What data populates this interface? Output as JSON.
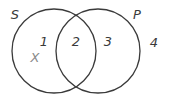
{
  "diagram": {
    "type": "venn",
    "stroke_color": "#3a3a3a",
    "sets": [
      {
        "id": "S",
        "label": "S",
        "cx": 54,
        "cy": 51,
        "r": 42
      },
      {
        "id": "P",
        "label": "P",
        "cx": 98,
        "cy": 51,
        "r": 42
      }
    ],
    "set_labels": [
      {
        "text": "S",
        "x": 15,
        "y": 14
      },
      {
        "text": "P",
        "x": 137,
        "y": 14
      }
    ],
    "regions": [
      {
        "text": "1",
        "x": 44,
        "y": 41
      },
      {
        "text": "2",
        "x": 76,
        "y": 41
      },
      {
        "text": "3",
        "x": 108,
        "y": 41
      },
      {
        "text": "4",
        "x": 154,
        "y": 42
      }
    ],
    "marker": {
      "text": "X",
      "x": 35,
      "y": 57,
      "color": "#8a8a8a"
    }
  }
}
